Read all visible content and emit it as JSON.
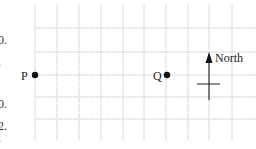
{
  "diagram": {
    "grid": {
      "vertical_x": [
        35,
        57,
        79,
        101,
        123,
        144,
        166,
        188,
        209,
        232
      ],
      "horizontal_y": [
        28,
        52,
        75,
        97,
        119
      ],
      "x_extent": [
        36,
        256
      ],
      "y_extent": [
        5,
        140
      ],
      "color": "#c8c8c8"
    },
    "points": [
      {
        "label": "P",
        "x": 35,
        "y": 75
      },
      {
        "label": "Q",
        "x": 167,
        "y": 75
      }
    ],
    "north_arrow": {
      "label": "North",
      "x": 209,
      "tip_y": 52,
      "base_y": 100,
      "crossbar_y": 84,
      "crossbar_x": [
        197,
        220
      ]
    },
    "clipped_left_margin_fragments": [
      {
        "text": "0.",
        "y": 44
      },
      {
        "text": ".",
        "y": 66
      },
      {
        "text": "0.",
        "y": 108
      },
      {
        "text": "2.",
        "y": 130
      },
      {
        "text": ".",
        "y": 142
      }
    ]
  }
}
